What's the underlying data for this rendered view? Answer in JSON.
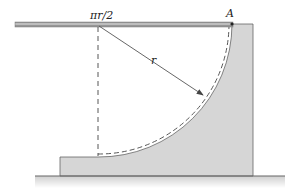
{
  "diagram": {
    "labels": {
      "top_point": "πr/2",
      "point_a": "A",
      "radius": "r"
    },
    "colors": {
      "block_fill": "#d6d6d6",
      "stroke": "#555555",
      "hatch": "#777777",
      "dashed": "#444444"
    }
  }
}
